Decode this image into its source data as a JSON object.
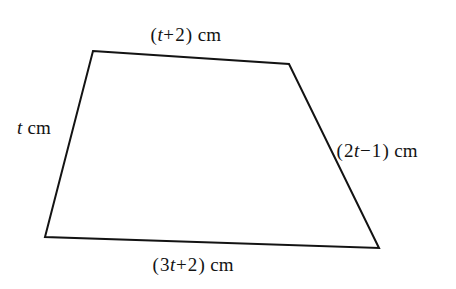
{
  "figure": {
    "type": "geometry-diagram",
    "shape_name": "quadrilateral-trapezium",
    "background_color": "#ffffff",
    "stroke_color": "#131313",
    "stroke_width": 2,
    "vertices": [
      {
        "name": "top-left",
        "x": 93,
        "y": 51
      },
      {
        "name": "top-right",
        "x": 289,
        "y": 64
      },
      {
        "name": "bottom-right",
        "x": 379,
        "y": 248
      },
      {
        "name": "bottom-left",
        "x": 45,
        "y": 237
      }
    ],
    "polygon_points": "93,51 289,64 379,248 45,237",
    "labels": {
      "top": {
        "full_text": "(t+2) cm",
        "open": "(",
        "variable": "t",
        "operator": "+",
        "constant": "2",
        "close": ")",
        "unit": "cm"
      },
      "left": {
        "full_text": "t cm",
        "variable": "t",
        "unit": "cm"
      },
      "right": {
        "full_text": "(2t−1) cm",
        "open": "(",
        "coefficient": "2",
        "variable": "t",
        "operator": "−",
        "constant": "1",
        "close": ")",
        "unit": "cm"
      },
      "bottom": {
        "full_text": "(3t+2) cm",
        "open": "(",
        "coefficient": "3",
        "variable": "t",
        "operator": "+",
        "constant": "2",
        "close": ")",
        "unit": "cm"
      }
    }
  }
}
